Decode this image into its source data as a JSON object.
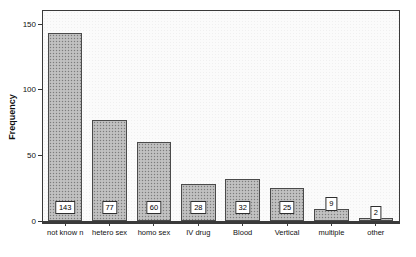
{
  "chart_data": {
    "type": "bar",
    "title": "",
    "xlabel": "",
    "ylabel": "Frequency",
    "ylim": [
      0,
      160
    ],
    "yticks": [
      0,
      50,
      100,
      150
    ],
    "ytick_labels": [
      "0",
      "50",
      "100",
      "150"
    ],
    "grid": false,
    "legend": false,
    "categories": [
      "not know n",
      "hetero sex",
      "homo sex",
      "IV drug",
      "Blood",
      "Vertical",
      "multiple",
      "other"
    ],
    "values": [
      143,
      77,
      60,
      28,
      32,
      25,
      9,
      2
    ],
    "value_labels": [
      "143",
      "77",
      "60",
      "28",
      "32",
      "25",
      "9",
      "2"
    ],
    "colors": {
      "bar_fill": "#b9b9b9",
      "bar_edge": "#4a4a4a",
      "plot_background": "#fbfbfb",
      "frame": "#3a3a3a",
      "text": "#111111",
      "label_box_background": "#ffffff"
    }
  }
}
